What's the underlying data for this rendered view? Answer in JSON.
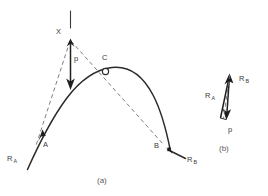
{
  "figure": {
    "panels": [
      {
        "id": "a",
        "caption": "(a)",
        "description": "trajectory-arc-with-force-vector",
        "labels": {
          "x_point": "X",
          "c_point": "C",
          "a_point": "A",
          "b_point": "B",
          "p_vector": "p",
          "ra_vector_base": "R",
          "ra_vector_sub": "A",
          "rb_vector_base": "R",
          "rb_vector_sub": "B"
        }
      },
      {
        "id": "b",
        "caption": "(b)",
        "description": "vector-triangle-inset",
        "labels": {
          "ra_vector_base": "R",
          "ra_vector_sub": "A",
          "rb_vector_base": "R",
          "rb_vector_sub": "B",
          "p_vector": "p"
        }
      }
    ],
    "colors": {
      "curve": "#2b2b2b",
      "dashed": "#6e6e6e",
      "vector": "#1f1f1f",
      "text": "#3c3c3c",
      "caption": "#5a5a5a",
      "background": "#ffffff"
    }
  }
}
